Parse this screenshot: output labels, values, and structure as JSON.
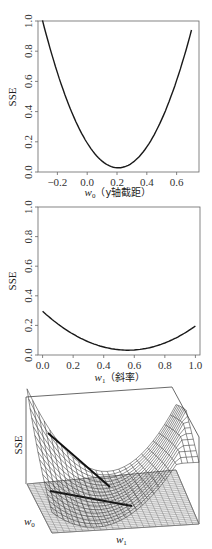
{
  "chart_data": [
    {
      "type": "line",
      "title": "",
      "xlabel": "w0（y轴截距）",
      "ylabel": "SSE",
      "xlim": [
        -0.33,
        0.75
      ],
      "ylim": [
        0.0,
        1.0
      ],
      "x_ticks": [
        "-0.2",
        "0.0",
        "0.2",
        "0.4",
        "0.6"
      ],
      "y_ticks": [
        "0.0",
        "0.2",
        "0.4",
        "0.6",
        "0.8",
        "1.0"
      ],
      "grid": false,
      "series": [
        {
          "name": "SSE vs w0",
          "x": [
            -0.3,
            -0.2,
            -0.1,
            0.0,
            0.1,
            0.2,
            0.21,
            0.3,
            0.4,
            0.5,
            0.6,
            0.7
          ],
          "y": [
            1.0,
            0.66,
            0.39,
            0.19,
            0.075,
            0.03,
            0.03,
            0.06,
            0.165,
            0.34,
            0.6,
            0.95
          ]
        }
      ]
    },
    {
      "type": "line",
      "title": "",
      "xlabel": "w1（斜率）",
      "ylabel": "SSE",
      "xlim": [
        -0.03,
        1.03
      ],
      "ylim": [
        0.0,
        1.0
      ],
      "x_ticks": [
        "0.0",
        "0.2",
        "0.4",
        "0.6",
        "0.8",
        "1.0"
      ],
      "y_ticks": [
        "0.0",
        "0.2",
        "0.4",
        "0.6",
        "0.8",
        "1.0"
      ],
      "grid": false,
      "series": [
        {
          "name": "SSE vs w1",
          "x": [
            0.0,
            0.1,
            0.2,
            0.3,
            0.4,
            0.5,
            0.57,
            0.6,
            0.7,
            0.8,
            0.9,
            1.0
          ],
          "y": [
            0.29,
            0.21,
            0.145,
            0.095,
            0.057,
            0.035,
            0.03,
            0.031,
            0.045,
            0.08,
            0.13,
            0.2
          ]
        }
      ]
    },
    {
      "type": "surface",
      "title": "",
      "xlabel": "w1",
      "ylabel": "w0",
      "zlabel": "SSE",
      "description": "3D wireframe bowl-shaped SSE surface over (w0, w1) with its contour projection on the floor plane; a dark line marks the valley of minimum SSE"
    }
  ],
  "labels": {
    "sse": "SSE",
    "w0_symbol": "w",
    "w0_sub": "0",
    "w0_desc": "（y轴截距）",
    "w1_symbol": "w",
    "w1_sub": "1",
    "w1_desc": "（斜率）",
    "surf_w0": "w",
    "surf_w0_sub": "0",
    "surf_w1": "w",
    "surf_w1_sub": "1"
  },
  "colors": {
    "line": "#1a1a1a",
    "frame": "#555555",
    "mesh": "#3a3a3a",
    "floor_mesh": "#666666"
  }
}
